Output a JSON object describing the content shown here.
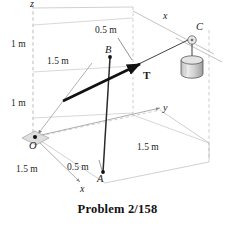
{
  "figure": {
    "caption": "Problem 2/158",
    "axes": [
      {
        "name": "z-axis-label",
        "text": "z",
        "x": 30,
        "y": 0
      },
      {
        "name": "x-axis-label-upper",
        "text": "x",
        "x": 163,
        "y": 12
      },
      {
        "name": "y-axis-label",
        "text": "y",
        "x": 163,
        "y": 103
      },
      {
        "name": "x-axis-label-lower",
        "text": "x",
        "x": 80,
        "y": 184
      }
    ],
    "points": [
      {
        "name": "point-o",
        "text": "O",
        "x": 30,
        "y": 142
      },
      {
        "name": "point-a",
        "text": "A",
        "x": 97,
        "y": 175
      },
      {
        "name": "point-b",
        "text": "B",
        "x": 106,
        "y": 49
      },
      {
        "name": "point-c",
        "text": "C",
        "x": 196,
        "y": 25
      }
    ],
    "dimensions": [
      {
        "name": "dim-vertical-upper",
        "text": "1 m",
        "x": 12,
        "y": 41
      },
      {
        "name": "dim-vertical-lower",
        "text": "1 m",
        "x": 12,
        "y": 100
      },
      {
        "name": "dim-bc-offset",
        "text": "0.5 m",
        "x": 96,
        "y": 27
      },
      {
        "name": "dim-ob-horizontal",
        "text": "1.5 m",
        "x": 48,
        "y": 58
      },
      {
        "name": "dim-ground-left",
        "text": "1.5 m",
        "x": 17,
        "y": 166
      },
      {
        "name": "dim-oa-offset",
        "text": "0.5 m",
        "x": 68,
        "y": 164
      },
      {
        "name": "dim-ground-right",
        "text": "1.5 m",
        "x": 138,
        "y": 144
      }
    ],
    "force": {
      "name": "tension-label",
      "text": "T",
      "x": 143,
      "y": 72
    },
    "colors": {
      "construction_line": "#9a9a9a",
      "dashed_line": "#a8a8a8",
      "cable": "#1a1a1a",
      "cylinder_fill": "#d4d4d4",
      "cylinder_stroke": "#4a4a4a",
      "text": "#1c1c1c",
      "background": "#ffffff"
    }
  }
}
